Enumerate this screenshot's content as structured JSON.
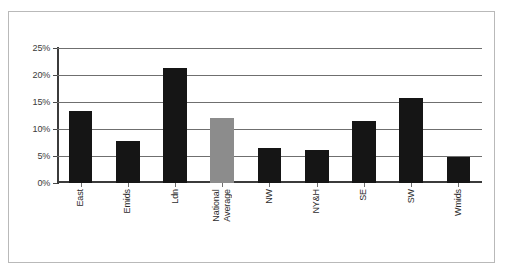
{
  "chart_data": {
    "type": "bar",
    "title": "",
    "xlabel": "",
    "ylabel": "",
    "ylim": [
      0,
      25
    ],
    "grid": true,
    "legend": false,
    "ytick_labels": [
      "25%",
      "20%",
      "15%",
      "10%",
      "5%",
      "0%"
    ],
    "ytick_values": [
      25,
      20,
      15,
      10,
      5,
      0
    ],
    "categories": [
      "East",
      "Emids",
      "Ldn",
      "National Average",
      "NW",
      "NY&H",
      "SE",
      "SW",
      "Wmids"
    ],
    "values": [
      13.4,
      7.8,
      21.3,
      12.0,
      6.5,
      6.1,
      11.5,
      15.8,
      4.9
    ],
    "colors": {
      "bar": "#151515",
      "highlight_bar": "#8c8c8c",
      "axis": "#3b3b3b",
      "gridline": "#6f6f6f",
      "frame_border": "#b9b9b9"
    },
    "highlight_category": "National Average"
  }
}
